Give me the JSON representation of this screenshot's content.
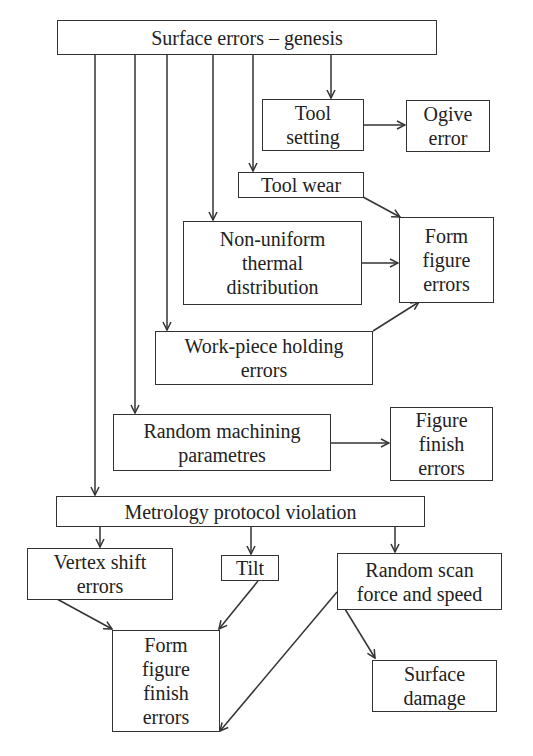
{
  "diagram": {
    "nodes": [
      {
        "id": "surface_errors_genesis",
        "label": "Surface errors – genesis"
      },
      {
        "id": "tool_setting",
        "label": "Tool\nsetting"
      },
      {
        "id": "ogive_error",
        "label": "Ogive\nerror"
      },
      {
        "id": "tool_wear",
        "label": "Tool wear"
      },
      {
        "id": "non_uniform_thermal",
        "label": "Non-uniform\nthermal\ndistribution"
      },
      {
        "id": "form_figure_errors",
        "label": "Form\nfigure\nerrors"
      },
      {
        "id": "work_piece_holding",
        "label": "Work-piece holding\nerrors"
      },
      {
        "id": "random_machining",
        "label": "Random machining\nparametres"
      },
      {
        "id": "figure_finish_errors",
        "label": "Figure\nfinish\nerrors"
      },
      {
        "id": "metrology_protocol",
        "label": "Metrology protocol violation"
      },
      {
        "id": "vertex_shift",
        "label": "Vertex shift\nerrors"
      },
      {
        "id": "tilt",
        "label": "Tilt"
      },
      {
        "id": "random_scan",
        "label": "Random scan\nforce and speed"
      },
      {
        "id": "form_figure_finish_errors",
        "label": "Form\nfigure\nfinish\nerrors"
      },
      {
        "id": "surface_damage",
        "label": "Surface\ndamage"
      }
    ],
    "edges": [
      {
        "from": "surface_errors_genesis",
        "to": "tool_setting"
      },
      {
        "from": "surface_errors_genesis",
        "to": "tool_wear"
      },
      {
        "from": "surface_errors_genesis",
        "to": "non_uniform_thermal"
      },
      {
        "from": "surface_errors_genesis",
        "to": "work_piece_holding"
      },
      {
        "from": "surface_errors_genesis",
        "to": "random_machining"
      },
      {
        "from": "surface_errors_genesis",
        "to": "metrology_protocol"
      },
      {
        "from": "tool_setting",
        "to": "ogive_error"
      },
      {
        "from": "tool_wear",
        "to": "form_figure_errors"
      },
      {
        "from": "non_uniform_thermal",
        "to": "form_figure_errors"
      },
      {
        "from": "work_piece_holding",
        "to": "form_figure_errors"
      },
      {
        "from": "random_machining",
        "to": "figure_finish_errors"
      },
      {
        "from": "metrology_protocol",
        "to": "vertex_shift"
      },
      {
        "from": "metrology_protocol",
        "to": "tilt"
      },
      {
        "from": "metrology_protocol",
        "to": "random_scan"
      },
      {
        "from": "vertex_shift",
        "to": "form_figure_finish_errors"
      },
      {
        "from": "tilt",
        "to": "form_figure_finish_errors"
      },
      {
        "from": "random_scan",
        "to": "form_figure_finish_errors"
      },
      {
        "from": "random_scan",
        "to": "surface_damage"
      }
    ]
  }
}
